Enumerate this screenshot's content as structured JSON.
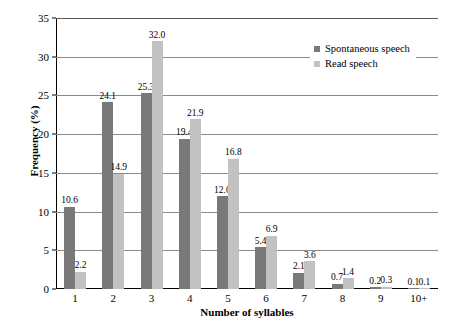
{
  "chart_data": {
    "type": "bar",
    "title": "",
    "xlabel": "Number of syllables",
    "ylabel": "Frequency (%)",
    "categories": [
      "1",
      "2",
      "3",
      "4",
      "5",
      "6",
      "7",
      "8",
      "9",
      "10+"
    ],
    "series": [
      {
        "name": "Spontaneous speech",
        "color": "#797979",
        "values": [
          10.6,
          24.1,
          25.3,
          19.4,
          12.0,
          5.4,
          2.1,
          0.7,
          0.2,
          0.1
        ],
        "labels": [
          "10.6",
          "24.1",
          "25.3",
          "19.4",
          "12.0",
          "5.4",
          "2.1",
          "0.7",
          "0.2",
          "0.1"
        ]
      },
      {
        "name": "Read speech",
        "color": "#c2c2c2",
        "values": [
          2.2,
          14.9,
          32.0,
          21.9,
          16.8,
          6.9,
          3.6,
          1.4,
          0.3,
          0.1
        ],
        "labels": [
          "2.2",
          "14.9",
          "32.0",
          "21.9",
          "16.8",
          "6.9",
          "3.6",
          "1.4",
          "0.3",
          "0.1"
        ]
      }
    ],
    "ylim": [
      0,
      35
    ],
    "yticks": [
      0,
      5,
      10,
      15,
      20,
      25,
      30,
      35
    ],
    "ytick_labels": [
      "0",
      "5",
      "10",
      "15",
      "20",
      "25",
      "30",
      "35"
    ],
    "grid": true,
    "legend_position": "top-right-inside"
  }
}
